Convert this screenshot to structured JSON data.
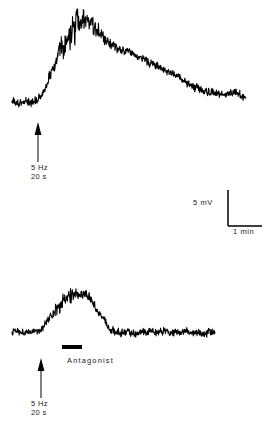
{
  "figure": {
    "background_color": "#ffffff",
    "trace_color": "#000000",
    "width": 270,
    "height": 436
  },
  "panels": [
    {
      "id": "top-panel",
      "name": "control-trace",
      "stimulus": {
        "frequency": "5 Hz",
        "duration": "20 s",
        "marker": "upward-arrow"
      },
      "drug": null
    },
    {
      "id": "bottom-panel",
      "name": "antagonist-trace",
      "stimulus": {
        "frequency": "5 Hz",
        "duration": "20 s",
        "marker": "upward-arrow"
      },
      "drug": {
        "label": "Antagonist",
        "marker": "horizontal-bar"
      }
    }
  ],
  "scale_bar": {
    "vertical_label": "5 mV",
    "horizontal_label": "1 min",
    "vertical_value": 5,
    "vertical_unit": "mV",
    "horizontal_value": 1,
    "horizontal_unit": "min",
    "shape": "L"
  },
  "chart_data": {
    "type": "line",
    "xlabel": "",
    "ylabel": "",
    "axis_visible": false,
    "grid": false,
    "legend": false,
    "annotations": [
      {
        "text": "5 Hz",
        "panel": "top",
        "kind": "stimulus-frequency"
      },
      {
        "text": "20 s",
        "panel": "top",
        "kind": "stimulus-duration"
      },
      {
        "text": "5 mV",
        "panel": "scale",
        "kind": "vertical-calibration"
      },
      {
        "text": "1 min",
        "panel": "scale",
        "kind": "horizontal-calibration"
      },
      {
        "text": "Antagonist",
        "panel": "bottom",
        "kind": "drug-application"
      },
      {
        "text": "5 Hz",
        "panel": "bottom",
        "kind": "stimulus-frequency"
      },
      {
        "text": "20 s",
        "panel": "bottom",
        "kind": "stimulus-duration"
      }
    ],
    "series": [
      {
        "name": "control",
        "panel": "top",
        "units_y": "mV",
        "units_x": "min",
        "x_start_px": 12,
        "x_end_px": 246,
        "baseline_px": 101,
        "peak_px": 18,
        "peak_x_px": 80,
        "noise_amplitude_px": 3.4,
        "peak_noise_amplitude_px": 9.5,
        "envelope": [
          [
            12,
            101
          ],
          [
            18,
            103
          ],
          [
            24,
            101
          ],
          [
            30,
            102
          ],
          [
            36,
            100
          ],
          [
            40,
            97
          ],
          [
            44,
            90
          ],
          [
            48,
            80
          ],
          [
            52,
            70
          ],
          [
            56,
            60
          ],
          [
            60,
            50
          ],
          [
            64,
            43
          ],
          [
            68,
            36
          ],
          [
            72,
            30
          ],
          [
            76,
            24
          ],
          [
            80,
            19
          ],
          [
            84,
            22
          ],
          [
            88,
            26
          ],
          [
            92,
            24
          ],
          [
            96,
            28
          ],
          [
            100,
            33
          ],
          [
            104,
            38
          ],
          [
            108,
            42
          ],
          [
            112,
            45
          ],
          [
            116,
            48
          ],
          [
            122,
            50
          ],
          [
            128,
            52
          ],
          [
            134,
            55
          ],
          [
            140,
            58
          ],
          [
            146,
            61
          ],
          [
            152,
            64
          ],
          [
            158,
            67
          ],
          [
            164,
            70
          ],
          [
            170,
            73
          ],
          [
            176,
            76
          ],
          [
            182,
            80
          ],
          [
            188,
            84
          ],
          [
            194,
            87
          ],
          [
            200,
            90
          ],
          [
            206,
            92
          ],
          [
            212,
            93
          ],
          [
            218,
            94
          ],
          [
            224,
            94
          ],
          [
            230,
            93
          ],
          [
            236,
            94
          ],
          [
            241,
            95
          ],
          [
            246,
            96
          ]
        ]
      },
      {
        "name": "antagonist",
        "panel": "bottom",
        "units_y": "mV",
        "units_x": "min",
        "x_start_px": 12,
        "x_end_px": 215,
        "baseline_px": 333,
        "peak_px": 292,
        "peak_x_px": 76,
        "noise_amplitude_px": 3.0,
        "peak_noise_amplitude_px": 4.6,
        "envelope": [
          [
            12,
            333
          ],
          [
            18,
            331
          ],
          [
            24,
            334
          ],
          [
            30,
            332
          ],
          [
            36,
            333
          ],
          [
            40,
            331
          ],
          [
            44,
            326
          ],
          [
            48,
            320
          ],
          [
            52,
            314
          ],
          [
            56,
            309
          ],
          [
            60,
            305
          ],
          [
            64,
            301
          ],
          [
            68,
            298
          ],
          [
            72,
            295
          ],
          [
            76,
            293
          ],
          [
            80,
            296
          ],
          [
            84,
            293
          ],
          [
            88,
            296
          ],
          [
            92,
            302
          ],
          [
            96,
            308
          ],
          [
            100,
            314
          ],
          [
            104,
            320
          ],
          [
            108,
            326
          ],
          [
            112,
            330
          ],
          [
            116,
            332
          ],
          [
            122,
            333
          ],
          [
            128,
            332
          ],
          [
            134,
            334
          ],
          [
            140,
            332
          ],
          [
            146,
            333
          ],
          [
            152,
            331
          ],
          [
            158,
            333
          ],
          [
            164,
            330
          ],
          [
            170,
            332
          ],
          [
            176,
            331
          ],
          [
            182,
            333
          ],
          [
            188,
            331
          ],
          [
            194,
            333
          ],
          [
            200,
            332
          ],
          [
            206,
            333
          ],
          [
            210,
            332
          ],
          [
            215,
            333
          ]
        ]
      }
    ]
  },
  "markers": {
    "arrow_top": {
      "x": 38,
      "y_tip": 122,
      "y_tail": 162
    },
    "arrow_bottom": {
      "x": 41,
      "y_tip": 358,
      "y_tail": 398
    },
    "drug_bar": {
      "x": 62,
      "y": 345,
      "width": 20,
      "height": 4
    },
    "scale_vertical": {
      "x": 228,
      "y_top": 190,
      "y_bottom": 226
    },
    "scale_horizontal": {
      "y": 226,
      "x_left": 228,
      "x_right": 262
    }
  }
}
